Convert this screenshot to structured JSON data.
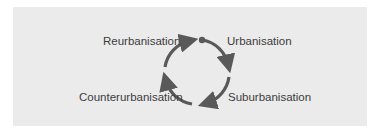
{
  "diagram": {
    "type": "cycle",
    "colors": {
      "background": "#ebebeb",
      "text": "#3c3c3c",
      "arrow": "#595959"
    },
    "stages": [
      {
        "label": "Urbanisation",
        "position": "top-right"
      },
      {
        "label": "Suburbanisation",
        "position": "bottom-right"
      },
      {
        "label": "Counterurbanisation",
        "position": "bottom-left"
      },
      {
        "label": "Reurbanisation",
        "position": "top-left"
      }
    ],
    "direction": "clockwise",
    "start_marker": "dot at top"
  }
}
